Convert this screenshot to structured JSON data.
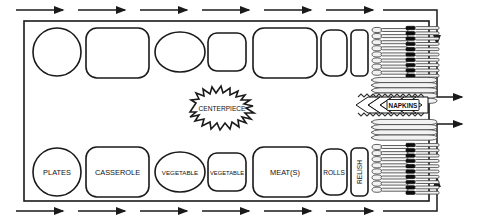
{
  "diagram": {
    "centerpiece": {
      "label": "CENTERPIECE"
    },
    "napkins": {
      "label": "NAPKINS"
    },
    "table": {
      "border_color": "#1a1a1a",
      "fill_color": "#ffffff"
    },
    "bottom_row_dishes": [
      {
        "id": "plates",
        "label": "PLATES",
        "shape": "circle",
        "cx": 57,
        "cy": 172,
        "rx": 24,
        "ry": 25,
        "font_size": 7.4
      },
      {
        "id": "casserole",
        "label": "CASSEROLE",
        "shape": "rounded-rect",
        "x": 86,
        "y": 147,
        "w": 63,
        "h": 50,
        "r": 11,
        "font_size": 7.4
      },
      {
        "id": "vegetable-1",
        "label": "VEGETABLE",
        "shape": "ellipse",
        "cx": 180,
        "cy": 172,
        "rx": 25,
        "ry": 20,
        "font_size": 6.2
      },
      {
        "id": "vegetable-2",
        "label": "VEGETABLE",
        "shape": "rounded-rect",
        "x": 208,
        "y": 153,
        "w": 38,
        "h": 38,
        "r": 9,
        "font_size": 5.8
      },
      {
        "id": "meats",
        "label": "MEAT(S)",
        "shape": "rounded-rect",
        "x": 253,
        "y": 147,
        "w": 64,
        "h": 50,
        "r": 11,
        "font_size": 7.4
      },
      {
        "id": "rolls",
        "label": "ROLLS",
        "shape": "rounded-rect",
        "x": 321,
        "y": 149,
        "w": 26,
        "h": 46,
        "r": 9,
        "font_size": 6.6
      },
      {
        "id": "relish",
        "label": "RELISH",
        "shape": "rounded-rect-vertical",
        "x": 351,
        "y": 148,
        "w": 17,
        "h": 48,
        "r": 5,
        "font_size": 6.6,
        "rotated": true
      }
    ],
    "top_row_dishes": [
      {
        "id": "plates-stack",
        "shape": "circle",
        "cx": 57,
        "cy": 52,
        "rx": 24,
        "ry": 25
      },
      {
        "id": "casserole-top",
        "shape": "rounded-rect",
        "x": 86,
        "y": 28,
        "w": 63,
        "h": 50,
        "r": 11
      },
      {
        "id": "vegetable-top-1",
        "shape": "ellipse",
        "cx": 180,
        "cy": 52,
        "rx": 25,
        "ry": 20
      },
      {
        "id": "vegetable-top-2",
        "shape": "rounded-rect",
        "x": 208,
        "y": 33,
        "w": 38,
        "h": 38,
        "r": 9
      },
      {
        "id": "meats-top",
        "shape": "rounded-rect",
        "x": 253,
        "y": 28,
        "w": 64,
        "h": 50,
        "r": 11
      },
      {
        "id": "rolls-top",
        "shape": "rounded-rect",
        "x": 321,
        "y": 30,
        "w": 26,
        "h": 46,
        "r": 9
      },
      {
        "id": "relish-top",
        "shape": "rounded-rect",
        "x": 351,
        "y": 30,
        "w": 17,
        "h": 46,
        "r": 5
      }
    ],
    "utensil_groups": [
      {
        "id": "spoons-top",
        "type": "spoons",
        "count": 8,
        "orientation": "horizontal",
        "x": 372,
        "y": 29,
        "item_w": 36,
        "spacing": 6.1
      },
      {
        "id": "forks-top",
        "type": "forks",
        "count": 9,
        "orientation": "horizontal",
        "x": 408,
        "y": 29,
        "item_w": 31,
        "spacing": 5.4
      },
      {
        "id": "knives-upper",
        "type": "knives",
        "count": 5,
        "orientation": "horizontal-wide",
        "x": 372,
        "y": 80,
        "item_w": 66,
        "spacing": 5.0
      },
      {
        "id": "knives-lower",
        "type": "knives",
        "count": 4,
        "orientation": "horizontal-wide",
        "x": 372,
        "y": 124,
        "item_w": 66,
        "spacing": 5.0
      },
      {
        "id": "spoons-bottom",
        "type": "spoons",
        "count": 8,
        "orientation": "horizontal",
        "x": 372,
        "y": 145,
        "item_w": 36,
        "spacing": 6.1
      },
      {
        "id": "forks-bottom",
        "type": "forks",
        "count": 9,
        "orientation": "horizontal",
        "x": 408,
        "y": 145,
        "item_w": 31,
        "spacing": 5.4
      }
    ],
    "flow_arrows": {
      "top_count": 6,
      "bottom_count": 6,
      "right_count": 4,
      "direction_top": "right",
      "direction_bottom": "right",
      "description": "traffic flow arrows"
    }
  }
}
